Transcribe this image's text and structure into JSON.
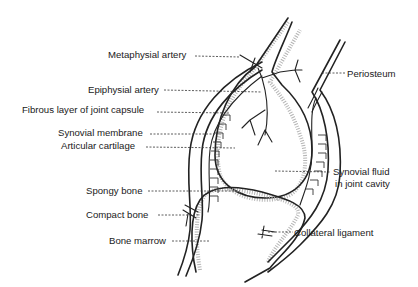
{
  "labels": {
    "metaphysial_artery": "Metaphysial artery",
    "epiphysial_artery": "Epiphysial artery",
    "fibrous_layer": "Fibrous layer of joint capsule",
    "synovial_membrane": "Synovial membrane",
    "articular_cartilage": "Articular cartilage",
    "spongy_bone": "Spongy bone",
    "compact_bone": "Compact bone",
    "bone_marrow": "Bone marrow",
    "periosteum": "Periosteum",
    "synovial_fluid_1": "Synovial fluid",
    "synovial_fluid_2": "in joint cavity",
    "collateral_ligament": "Collateral ligament"
  },
  "colors": {
    "line": "#222222",
    "spongy": "#b5b5b5",
    "background": "#ffffff"
  }
}
